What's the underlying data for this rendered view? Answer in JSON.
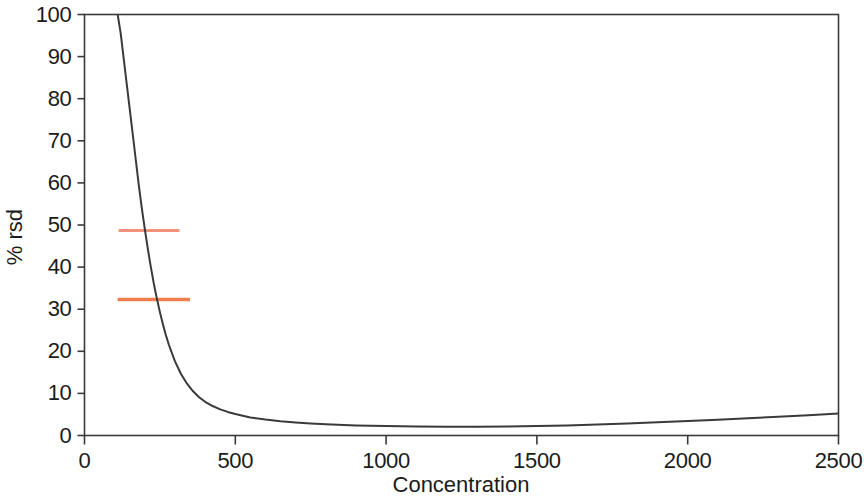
{
  "chart_data": {
    "type": "line",
    "title": "",
    "subtitle": "",
    "xlabel": "Concentration",
    "ylabel": "% rsd",
    "xlim": [
      0,
      2500
    ],
    "ylim": [
      0,
      100
    ],
    "xticks": [
      0,
      500,
      1000,
      1500,
      2000,
      2500
    ],
    "xtick_labels": [
      "0",
      "500",
      "1000",
      "1500",
      "2000",
      "2500"
    ],
    "yticks": [
      0,
      10,
      20,
      30,
      40,
      50,
      60,
      70,
      80,
      90,
      100
    ],
    "ytick_labels": [
      "0",
      "10",
      "20",
      "30",
      "40",
      "50",
      "60",
      "70",
      "80",
      "90",
      "100"
    ],
    "grid": false,
    "legend": "none",
    "series": [
      {
        "name": "% rsd vs concentration",
        "color": "#3a3a3a",
        "linewidth": 2,
        "x": [
          110,
          120,
          130,
          140,
          150,
          160,
          170,
          180,
          190,
          200,
          210,
          220,
          230,
          240,
          250,
          260,
          270,
          280,
          300,
          320,
          340,
          360,
          380,
          400,
          425,
          450,
          475,
          500,
          550,
          600,
          650,
          700,
          750,
          800,
          900,
          1000,
          1100,
          1200,
          1300,
          1400,
          1500,
          1600,
          1700,
          1800,
          1900,
          2000,
          2100,
          2200,
          2300,
          2400,
          2500
        ],
        "y": [
          100,
          95.5,
          89.5,
          83.5,
          77.5,
          71.5,
          65.5,
          59.5,
          54.0,
          49.0,
          44.3,
          40.0,
          36.0,
          32.5,
          29.3,
          26.4,
          23.8,
          21.5,
          17.6,
          14.6,
          12.3,
          10.5,
          9.1,
          8.0,
          7.0,
          6.2,
          5.6,
          5.1,
          4.3,
          3.8,
          3.4,
          3.1,
          2.85,
          2.65,
          2.4,
          2.25,
          2.15,
          2.1,
          2.1,
          2.15,
          2.25,
          2.4,
          2.6,
          2.85,
          3.15,
          3.45,
          3.75,
          4.1,
          4.45,
          4.8,
          5.2
        ]
      }
    ],
    "annotations": [
      {
        "name": "upper-threshold-marker",
        "type": "hline-segment",
        "y": 48.7,
        "x_start": 113,
        "x_end": 315,
        "color": "#f4937c",
        "linewidth": 3
      },
      {
        "name": "lower-threshold-marker",
        "type": "hline-segment",
        "y": 32.3,
        "x_start": 110,
        "x_end": 350,
        "color": "#ef7f4f",
        "linewidth": 3.5
      }
    ],
    "axes_style": {
      "frame": "box",
      "frame_color": "#3a3a3a",
      "tick_direction": "out",
      "background": "#ffffff"
    }
  }
}
